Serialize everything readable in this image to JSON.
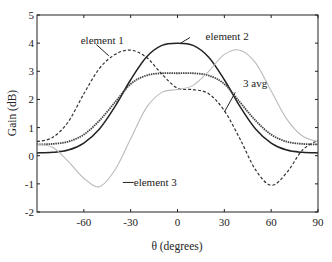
{
  "chart_data": {
    "type": "line",
    "title": "",
    "xlabel": "θ (degrees)",
    "ylabel": "Gain (dB)",
    "xlim": [
      -90,
      90
    ],
    "ylim": [
      -2,
      5
    ],
    "xticks": [
      -60,
      -30,
      0,
      30,
      60,
      90
    ],
    "yticks": [
      -2,
      -1,
      0,
      1,
      2,
      3,
      4,
      5
    ],
    "grid": false,
    "legend": "inline annotations",
    "x": [
      -90,
      -80,
      -70,
      -60,
      -50,
      -40,
      -30,
      -20,
      -10,
      0,
      10,
      20,
      30,
      40,
      50,
      60,
      70,
      80,
      90
    ],
    "series": [
      {
        "name": "element 1",
        "style": "dashed",
        "color": "#333333",
        "values": [
          0.5,
          0.65,
          1.2,
          2.2,
          3.1,
          3.6,
          3.75,
          3.5,
          2.9,
          2.4,
          2.35,
          2.2,
          1.6,
          0.6,
          -0.5,
          -1.05,
          -0.6,
          0.2,
          0.55
        ]
      },
      {
        "name": "element 2",
        "style": "solid",
        "color": "#222222",
        "values": [
          0.1,
          0.12,
          0.2,
          0.45,
          0.95,
          1.75,
          2.7,
          3.5,
          3.92,
          4.0,
          3.92,
          3.5,
          2.7,
          1.75,
          0.95,
          0.45,
          0.2,
          0.12,
          0.1
        ]
      },
      {
        "name": "3 avg",
        "style": "dotted-solid",
        "color": "#444444",
        "values": [
          0.4,
          0.42,
          0.5,
          0.75,
          1.25,
          1.9,
          2.55,
          2.85,
          2.93,
          2.93,
          2.93,
          2.85,
          2.55,
          1.9,
          1.25,
          0.75,
          0.5,
          0.42,
          0.4
        ]
      },
      {
        "name": "element 3",
        "style": "solid-light",
        "color": "#bbbbbb",
        "values": [
          0.4,
          0.3,
          -0.2,
          -0.8,
          -1.1,
          -0.5,
          0.6,
          1.7,
          2.25,
          2.35,
          2.5,
          3.0,
          3.6,
          3.75,
          3.3,
          2.3,
          1.3,
          0.7,
          0.5
        ]
      }
    ],
    "annotations": [
      {
        "text": "element 1",
        "x": -62,
        "y": 4.1
      },
      {
        "text": "element 2",
        "x": 18,
        "y": 4.25
      },
      {
        "text": "3 avg",
        "x": 42,
        "y": 2.6
      },
      {
        "text": "element 3",
        "x": -28,
        "y": -0.95
      }
    ]
  }
}
